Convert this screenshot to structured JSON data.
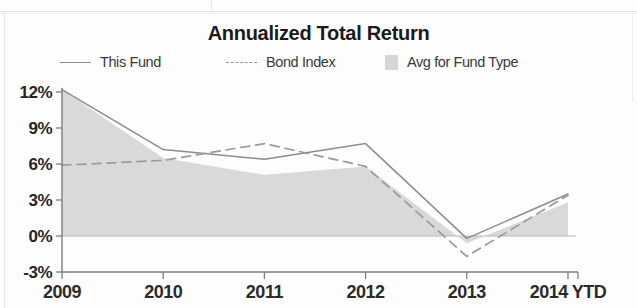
{
  "chart_data": {
    "type": "area",
    "title": "Annualized Total Return",
    "xlabel": "",
    "ylabel": "",
    "grid": false,
    "legend_position": "top",
    "categories": [
      "2009",
      "2010",
      "2011",
      "2012",
      "2013",
      "2014 YTD"
    ],
    "x_tick_labels": [
      "2009",
      "2010",
      "2011",
      "2012",
      "2013",
      "2014 YTD"
    ],
    "y_tick_labels": [
      "12%",
      "9%",
      "6%",
      "3%",
      "0%",
      "-3%"
    ],
    "y_tick_values": [
      12,
      9,
      6,
      3,
      0,
      -3
    ],
    "ylim": [
      -3,
      12
    ],
    "y_unit": "%",
    "series": [
      {
        "name": "This Fund",
        "style": "solid-line",
        "color": "#8d8d8d",
        "values": [
          12.2,
          7.2,
          6.4,
          7.7,
          -0.2,
          3.5
        ]
      },
      {
        "name": "Bond Index",
        "style": "dashed-line",
        "color": "#9a9a9a",
        "values": [
          5.9,
          6.3,
          7.7,
          5.8,
          -1.7,
          3.4
        ]
      },
      {
        "name": "Avg for Fund Type",
        "style": "filled-area",
        "color": "#d6d6d6",
        "values": [
          12.2,
          6.5,
          5.1,
          5.8,
          -0.6,
          2.8
        ]
      }
    ]
  },
  "legend": {
    "items": [
      {
        "label": "This Fund"
      },
      {
        "label": "Bond Index"
      },
      {
        "label": "Avg for Fund Type"
      }
    ]
  },
  "colors": {
    "area_fill": "#d6d6d6",
    "this_fund_line": "#8d8d8d",
    "bond_index_line": "#9a9a9a",
    "axis": "#7d7d7d",
    "text": "#262626",
    "background": "#fdfdfd"
  }
}
